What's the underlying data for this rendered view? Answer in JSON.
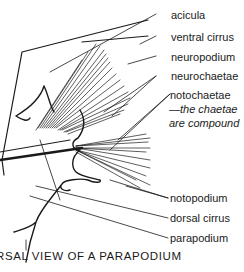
{
  "diagram": {
    "caption": "RSAL VIEW OF A PARAPODIUM",
    "labels": {
      "acicula": "acicula",
      "ventral_cirrus": "ventral cirrus",
      "neuropodium": "neuropodium",
      "neurochaetae": "neurochaetae",
      "notochaetae": "notochaetae",
      "notochaetae_note_1": "—the chaetae",
      "notochaetae_note_2": "are compound",
      "notopodium": "notopodium",
      "dorsal_cirrus": "dorsal cirrus",
      "parapodium": "parapodium"
    },
    "colors": {
      "ink": "#1a1a1a",
      "background": "#ffffff"
    }
  }
}
